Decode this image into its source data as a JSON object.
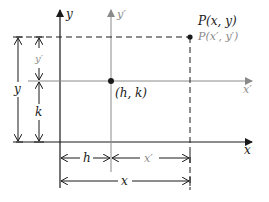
{
  "diagram": {
    "colors": {
      "primary": "#1a1a1a",
      "secondary": "#8a8a8a"
    },
    "axes": {
      "x_label": "x",
      "y_label": "y",
      "x_prime_label": "x′",
      "y_prime_label": "y′"
    },
    "points": {
      "origin_prime_label": "(h, k)",
      "P_label": "P(x, y)",
      "P_prime_label": "P(x′, y′)"
    },
    "dimensions": {
      "h": "h",
      "x_prime": "x′",
      "x": "x",
      "y": "y",
      "y_prime": "y′",
      "k": "k"
    }
  }
}
